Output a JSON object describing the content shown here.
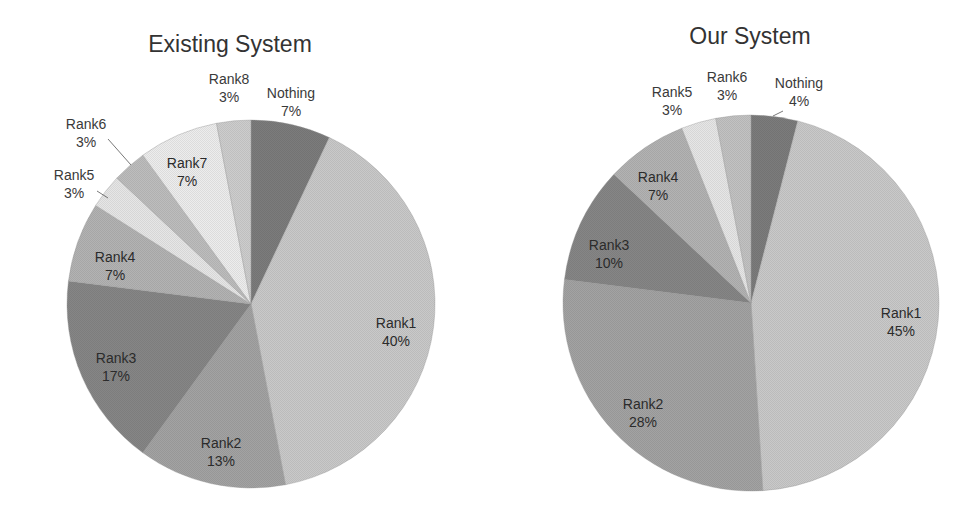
{
  "chart_data": [
    {
      "type": "pie",
      "title": "Existing System",
      "start_angle_deg": 0,
      "direction": "clockwise",
      "categories": [
        "Nothing",
        "Rank1",
        "Rank2",
        "Rank3",
        "Rank4",
        "Rank5",
        "Rank6",
        "Rank7",
        "Rank8"
      ],
      "values": [
        7,
        40,
        13,
        17,
        7,
        3,
        3,
        7,
        3
      ],
      "labels": [
        "7%",
        "40%",
        "13%",
        "17%",
        "7%",
        "3%",
        "3%",
        "7%",
        "3%"
      ],
      "colors": [
        "#7c7c7c",
        "#c9c9c9",
        "#a3a3a3",
        "#868686",
        "#b3b3b3",
        "#e6e6e6",
        "#bdbdbd",
        "#ededed",
        "#cdcdcd"
      ],
      "geometry": {
        "cx": 251,
        "cy": 304,
        "r": 184
      },
      "label_positions": [
        {
          "x": 291,
          "y": 98,
          "outside": true
        },
        {
          "x": 396,
          "y": 328,
          "outside": false
        },
        {
          "x": 221,
          "y": 448,
          "outside": false
        },
        {
          "x": 116,
          "y": 363,
          "outside": false
        },
        {
          "x": 115,
          "y": 262,
          "outside": false
        },
        {
          "x": 74,
          "y": 180,
          "outside": true,
          "leader": [
            [
              97,
              191
            ],
            [
              108,
              198
            ]
          ]
        },
        {
          "x": 86,
          "y": 129,
          "outside": true,
          "leader": [
            [
              108,
              139
            ],
            [
              131,
              165
            ]
          ]
        },
        {
          "x": 187,
          "y": 168,
          "outside": false
        },
        {
          "x": 229,
          "y": 84,
          "outside": true
        }
      ],
      "xlabel": "",
      "ylabel": "",
      "legend": "none"
    },
    {
      "type": "pie",
      "title": "Our System",
      "start_angle_deg": 0,
      "direction": "clockwise",
      "categories": [
        "Nothing",
        "Rank1",
        "Rank2",
        "Rank3",
        "Rank4",
        "Rank5",
        "Rank6"
      ],
      "values": [
        4,
        45,
        28,
        10,
        7,
        3,
        3
      ],
      "labels": [
        "4%",
        "45%",
        "28%",
        "10%",
        "7%",
        "3%",
        "3%"
      ],
      "colors": [
        "#7c7c7c",
        "#c9c9c9",
        "#a3a3a3",
        "#868686",
        "#b3b3b3",
        "#e6e6e6",
        "#c2c2c2"
      ],
      "geometry": {
        "cx": 751,
        "cy": 303,
        "r": 188
      },
      "label_positions": [
        {
          "x": 799,
          "y": 88,
          "outside": true,
          "leader": [
            [
              773,
              116
            ],
            [
              783,
              111
            ]
          ]
        },
        {
          "x": 901,
          "y": 318,
          "outside": false
        },
        {
          "x": 643,
          "y": 409,
          "outside": false
        },
        {
          "x": 609,
          "y": 250,
          "outside": false
        },
        {
          "x": 658,
          "y": 182,
          "outside": false
        },
        {
          "x": 672,
          "y": 97,
          "outside": true
        },
        {
          "x": 727,
          "y": 82,
          "outside": true
        }
      ],
      "xlabel": "",
      "ylabel": "",
      "legend": "none"
    }
  ]
}
